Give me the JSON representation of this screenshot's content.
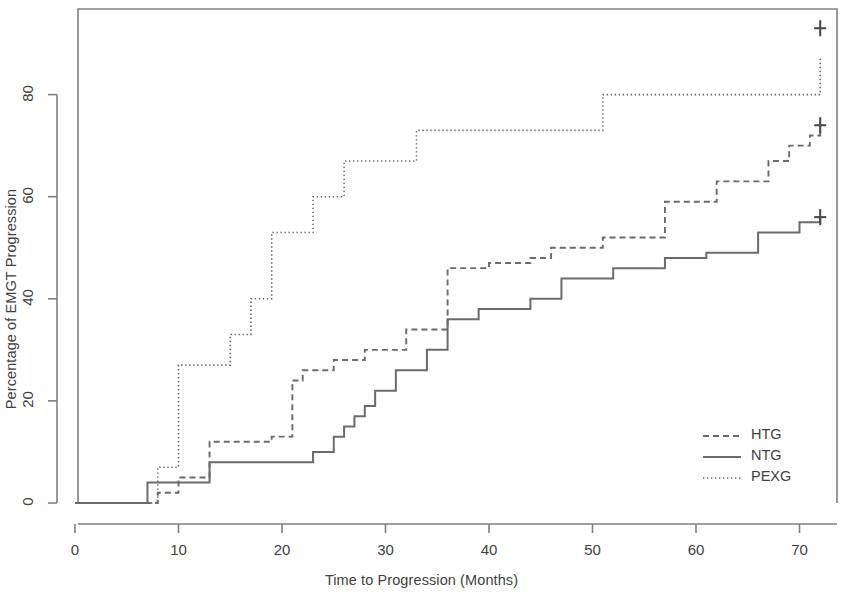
{
  "chart_data": {
    "type": "line",
    "title": "",
    "subtitle": "",
    "xlabel": "Time to Progression (Months)",
    "ylabel": "Percentage of EMGT Progression",
    "xlim": [
      -2,
      74
    ],
    "ylim": [
      -2,
      96
    ],
    "xticks": [
      0,
      10,
      20,
      30,
      40,
      50,
      60,
      70
    ],
    "xtick_labels": [
      "0",
      "10",
      "20",
      "30",
      "40",
      "50",
      "60",
      "70"
    ],
    "yticks": [
      0,
      20,
      40,
      60,
      80
    ],
    "ytick_labels": [
      "0",
      "20",
      "40",
      "60",
      "80"
    ],
    "grid": false,
    "legend_position": "bottom-right",
    "line_color": "#6b6b6b",
    "axis_color": "#808080",
    "text_color": "#3f3f3f",
    "step_type": "post",
    "series": [
      {
        "name": "HTG",
        "style": "dashed",
        "legend_label": "HTG",
        "censor_marks": [
          {
            "x": 72,
            "y": 74
          }
        ],
        "x": [
          0,
          7,
          8,
          9,
          10,
          12,
          13,
          18,
          19,
          20,
          21,
          22,
          24,
          25,
          27,
          28,
          31,
          32,
          34,
          36,
          39,
          40,
          43,
          44,
          45,
          46,
          47,
          51,
          52,
          57,
          58,
          62,
          63,
          67,
          68,
          69,
          70,
          71,
          72
        ],
        "y": [
          0,
          0,
          2,
          2,
          5,
          5,
          12,
          12,
          13,
          13,
          24,
          26,
          26,
          28,
          28,
          30,
          30,
          34,
          34,
          46,
          46,
          47,
          47,
          48,
          48,
          50,
          50,
          52,
          52,
          59,
          59,
          63,
          63,
          67,
          67,
          70,
          70,
          72,
          74
        ]
      },
      {
        "name": "NTG",
        "style": "solid",
        "legend_label": "NTG",
        "censor_marks": [
          {
            "x": 72,
            "y": 56
          }
        ],
        "x": [
          0,
          6,
          7,
          12,
          13,
          22,
          23,
          24,
          25,
          26,
          27,
          28,
          29,
          30,
          31,
          33,
          34,
          35,
          36,
          37,
          39,
          40,
          44,
          45,
          47,
          48,
          52,
          53,
          57,
          58,
          61,
          62,
          66,
          67,
          70,
          71,
          72
        ],
        "y": [
          0,
          0,
          4,
          4,
          8,
          8,
          10,
          10,
          13,
          15,
          17,
          19,
          22,
          22,
          26,
          26,
          30,
          30,
          36,
          36,
          38,
          38,
          40,
          40,
          44,
          44,
          46,
          46,
          48,
          48,
          49,
          49,
          53,
          53,
          55,
          55,
          56
        ]
      },
      {
        "name": "PEXG",
        "style": "dotted",
        "legend_label": "PEXG",
        "censor_marks": [
          {
            "x": 72,
            "y": 93
          }
        ],
        "x": [
          0,
          7,
          8,
          9,
          10,
          14,
          15,
          16,
          17,
          18,
          19,
          20,
          23,
          24,
          26,
          27,
          33,
          34,
          51,
          72
        ],
        "y": [
          0,
          0,
          7,
          7,
          27,
          27,
          33,
          33,
          40,
          40,
          53,
          53,
          60,
          60,
          67,
          67,
          73,
          73,
          80,
          87
        ]
      }
    ]
  },
  "legend": {
    "entries": [
      {
        "label": "HTG",
        "style": "dashed"
      },
      {
        "label": "NTG",
        "style": "solid"
      },
      {
        "label": "PEXG",
        "style": "dotted"
      }
    ]
  }
}
